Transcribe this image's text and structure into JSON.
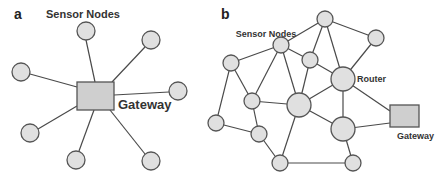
{
  "panels": {
    "a": {
      "letter": "a",
      "sensor_label": "Sensor Nodes",
      "gateway_label": "Gateway",
      "topology": "star",
      "gateway": {
        "x": 77,
        "y": 82,
        "w": 37,
        "h": 28
      },
      "nodes": [
        {
          "x": 86,
          "y": 31,
          "r": 9
        },
        {
          "x": 151,
          "y": 40,
          "r": 9
        },
        {
          "x": 21,
          "y": 72,
          "r": 9
        },
        {
          "x": 178,
          "y": 91,
          "r": 9
        },
        {
          "x": 30,
          "y": 133,
          "r": 9
        },
        {
          "x": 76,
          "y": 160,
          "r": 9
        },
        {
          "x": 151,
          "y": 161,
          "r": 9
        }
      ]
    },
    "b": {
      "letter": "b",
      "sensor_label": "Sensor Nodes",
      "router_label": "Router",
      "gateway_label": "Gateway",
      "topology": "mesh",
      "gateway": {
        "x": 390,
        "y": 105,
        "w": 29,
        "h": 22
      },
      "nodes": [
        {
          "id": "n1",
          "x": 325,
          "y": 19,
          "r": 8
        },
        {
          "id": "n2",
          "x": 376,
          "y": 38,
          "r": 8
        },
        {
          "id": "n3",
          "x": 281,
          "y": 45,
          "r": 8
        },
        {
          "id": "n4",
          "x": 231,
          "y": 63,
          "r": 8
        },
        {
          "id": "n5",
          "x": 310,
          "y": 60,
          "r": 8
        },
        {
          "id": "router",
          "x": 343,
          "y": 79,
          "r": 12
        },
        {
          "id": "n7",
          "x": 252,
          "y": 101,
          "r": 8
        },
        {
          "id": "center",
          "x": 299,
          "y": 105,
          "r": 12
        },
        {
          "id": "n9",
          "x": 216,
          "y": 123,
          "r": 8
        },
        {
          "id": "n10",
          "x": 259,
          "y": 134,
          "r": 8
        },
        {
          "id": "n11",
          "x": 343,
          "y": 129,
          "r": 12
        },
        {
          "id": "n12",
          "x": 280,
          "y": 163,
          "r": 8
        },
        {
          "id": "n13",
          "x": 353,
          "y": 163,
          "r": 8
        }
      ]
    }
  }
}
